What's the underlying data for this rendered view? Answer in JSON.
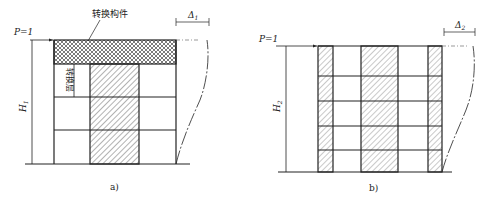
{
  "figure_a": {
    "caption": "a)",
    "load_label": "P=1",
    "height_label": "H",
    "height_sub": "1",
    "drift_label": "Δ",
    "drift_sub": "1",
    "transfer_member_label": "转换构件",
    "transfer_storey_label": "转换层",
    "storeys": 4
  },
  "figure_b": {
    "caption": "b)",
    "load_label": "P=1",
    "height_label": "H",
    "height_sub": "2",
    "drift_label": "Δ",
    "drift_sub": "2",
    "storeys": 5
  },
  "colors": {
    "line": "#222222",
    "hatch": "#555555",
    "background": "#ffffff"
  }
}
